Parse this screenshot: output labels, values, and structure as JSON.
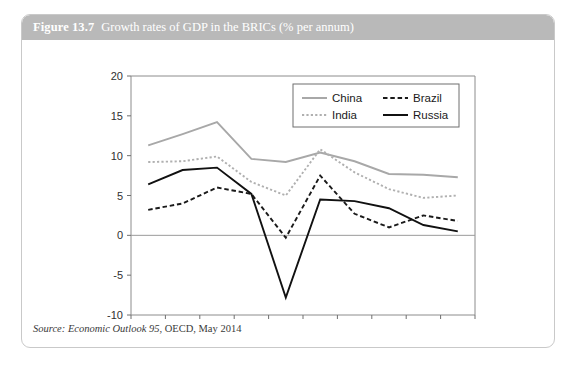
{
  "figure": {
    "number": "Figure 13.7",
    "caption": "Growth rates of GDP in the BRICs (% per annum)",
    "source_label": "Source:",
    "source_publication": "Economic Outlook 95",
    "source_rest": ", OECD, May 2014"
  },
  "chart_data": {
    "type": "line",
    "title": "Growth rates of GDP in the BRICs (% per annum)",
    "xlabel": "",
    "ylabel": "",
    "ylim": [
      -10,
      20
    ],
    "yticks": [
      20,
      15,
      10,
      5,
      0,
      -5,
      -10
    ],
    "ytick_labels": [
      "20",
      "15",
      "10",
      "5",
      "0",
      "-5",
      "-10"
    ],
    "grid": false,
    "zero_line": true,
    "legend_position": "top-right",
    "categories": [
      "2005",
      "2006",
      "2007",
      "2008",
      "2009",
      "2010",
      "2011",
      "2012",
      "2013",
      "2014"
    ],
    "x": [
      2005,
      2006,
      2007,
      2008,
      2009,
      2010,
      2011,
      2012,
      2013,
      2014
    ],
    "series": [
      {
        "name": "China",
        "style": "solid",
        "color": "#a8a8a8",
        "values": [
          11.3,
          12.7,
          14.2,
          9.6,
          9.2,
          10.4,
          9.3,
          7.7,
          7.6,
          7.3
        ]
      },
      {
        "name": "Brazil",
        "style": "dashed",
        "color": "#1a1a1a",
        "values": [
          3.2,
          4.0,
          6.0,
          5.2,
          -0.3,
          7.5,
          2.7,
          1.0,
          2.5,
          1.8
        ]
      },
      {
        "name": "India",
        "style": "dotted",
        "color": "#b0b0b0",
        "values": [
          9.2,
          9.3,
          9.9,
          6.7,
          5.0,
          10.8,
          7.9,
          5.8,
          4.7,
          5.0
        ]
      },
      {
        "name": "Russia",
        "style": "solid",
        "color": "#111111",
        "values": [
          6.4,
          8.2,
          8.5,
          5.2,
          -7.8,
          4.5,
          4.3,
          3.4,
          1.3,
          0.5
        ]
      }
    ],
    "legend_entries": [
      {
        "label": "China",
        "style": "solid",
        "color": "#a8a8a8"
      },
      {
        "label": "Brazil",
        "style": "dashed",
        "color": "#1a1a1a"
      },
      {
        "label": "India",
        "style": "dotted",
        "color": "#b0b0b0"
      },
      {
        "label": "Russia",
        "style": "solid",
        "color": "#111111"
      }
    ]
  },
  "colors": {
    "header_bar": "#b9b9b9",
    "frame_border": "#c9c9c9",
    "axis": "#6f6f6f",
    "zero_line": "#9a9a9a"
  }
}
